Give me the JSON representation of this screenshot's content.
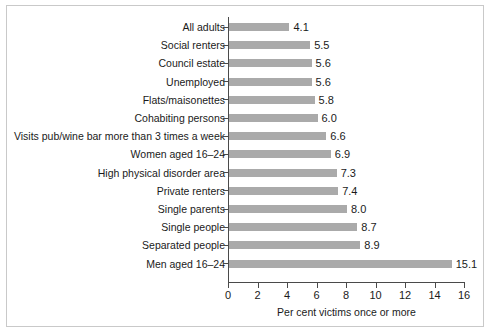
{
  "chart_data": {
    "type": "bar",
    "orientation": "horizontal",
    "title": "",
    "subtitle": "",
    "xlabel": "Per cent victims once or more",
    "ylabel": "",
    "xlim": [
      0,
      16
    ],
    "xticks": [
      0,
      2,
      4,
      6,
      8,
      10,
      12,
      14,
      16
    ],
    "xtick_labels": [
      "0",
      "2",
      "4",
      "6",
      "8",
      "10",
      "12",
      "14",
      "16"
    ],
    "grid": false,
    "legend": null,
    "bar_color": "#aaaaaa",
    "axis_color": "#4a4a4a",
    "text_color": "#1a1a1a",
    "categories": [
      "All adults",
      "Social renters",
      "Council estate",
      "Unemployed",
      "Flats/maisonettes",
      "Cohabiting persons",
      "Visits pub/wine bar more than 3 times a week",
      "Women aged 16–24",
      "High physical disorder area",
      "Private renters",
      "Single parents",
      "Single people",
      "Separated people",
      "Men aged 16–24"
    ],
    "values": [
      4.1,
      5.5,
      5.6,
      5.6,
      5.8,
      6.0,
      6.6,
      6.9,
      7.3,
      7.4,
      8.0,
      8.7,
      8.9,
      15.1
    ],
    "value_labels": [
      "4.1",
      "5.5",
      "5.6",
      "5.6",
      "5.8",
      "6.0",
      "6.6",
      "6.9",
      "7.3",
      "7.4",
      "8.0",
      "8.7",
      "8.9",
      "15.1"
    ]
  }
}
